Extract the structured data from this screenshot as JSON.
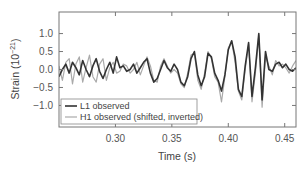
{
  "chart_data": {
    "type": "line",
    "title": "",
    "xlabel": "Time (s)",
    "ylabel": "Strain (10⁻²¹)",
    "ylabel_base": "Strain (10",
    "ylabel_exp": "−21",
    "ylabel_close": ")",
    "xlim": [
      0.25,
      0.46
    ],
    "ylim": [
      -1.6,
      1.6
    ],
    "xticks": [
      0.3,
      0.35,
      0.4,
      0.45
    ],
    "xtick_labels": [
      "0.30",
      "0.35",
      "0.40",
      "0.45"
    ],
    "yticks": [
      1.0,
      0.5,
      0.0,
      -0.5,
      -1.0
    ],
    "ytick_labels": [
      "1.0",
      "0.5",
      "0.0",
      "−0.5",
      "−1.0"
    ],
    "grid": false,
    "legend_position": "lower left",
    "series": [
      {
        "name": "L1 observed",
        "color": "#333333",
        "x": [
          0.25,
          0.253,
          0.256,
          0.259,
          0.262,
          0.265,
          0.268,
          0.271,
          0.274,
          0.277,
          0.28,
          0.283,
          0.286,
          0.289,
          0.292,
          0.295,
          0.298,
          0.301,
          0.304,
          0.307,
          0.31,
          0.313,
          0.316,
          0.319,
          0.322,
          0.325,
          0.328,
          0.331,
          0.334,
          0.337,
          0.34,
          0.343,
          0.346,
          0.349,
          0.352,
          0.355,
          0.358,
          0.361,
          0.364,
          0.367,
          0.37,
          0.373,
          0.376,
          0.379,
          0.382,
          0.385,
          0.388,
          0.391,
          0.394,
          0.397,
          0.4,
          0.403,
          0.406,
          0.409,
          0.412,
          0.415,
          0.418,
          0.421,
          0.424,
          0.427,
          0.43,
          0.433,
          0.436,
          0.439,
          0.442,
          0.445,
          0.448,
          0.451,
          0.454,
          0.457,
          0.46
        ],
        "values": [
          -0.2,
          0.0,
          0.15,
          -0.1,
          0.2,
          0.05,
          -0.15,
          0.25,
          0.0,
          -0.2,
          0.1,
          0.3,
          -0.05,
          -0.25,
          0.0,
          0.2,
          -0.1,
          0.35,
          0.05,
          0.1,
          -0.05,
          0.0,
          0.15,
          -0.1,
          0.05,
          0.2,
          0.3,
          -0.1,
          -0.35,
          -0.25,
          0.0,
          0.25,
          0.05,
          -0.05,
          0.15,
          0.0,
          -0.35,
          -0.45,
          -0.2,
          0.3,
          0.5,
          -0.15,
          -0.45,
          -0.2,
          0.45,
          0.35,
          -0.1,
          -0.3,
          -0.6,
          -0.15,
          0.55,
          0.8,
          0.35,
          -0.55,
          -0.75,
          0.1,
          0.75,
          -0.75,
          0.05,
          1.0,
          -0.85,
          0.5,
          0.0,
          -0.05,
          0.15,
          0.2,
          0.05,
          0.15,
          0.0,
          -0.05,
          0.05
        ]
      },
      {
        "name": "H1 observed (shifted, inverted)",
        "color": "#aaaaaa",
        "x": [
          0.25,
          0.253,
          0.256,
          0.259,
          0.262,
          0.265,
          0.268,
          0.271,
          0.274,
          0.277,
          0.28,
          0.283,
          0.286,
          0.289,
          0.292,
          0.295,
          0.298,
          0.301,
          0.304,
          0.307,
          0.31,
          0.313,
          0.316,
          0.319,
          0.322,
          0.325,
          0.328,
          0.331,
          0.334,
          0.337,
          0.34,
          0.343,
          0.346,
          0.349,
          0.352,
          0.355,
          0.358,
          0.361,
          0.364,
          0.367,
          0.37,
          0.373,
          0.376,
          0.379,
          0.382,
          0.385,
          0.388,
          0.391,
          0.394,
          0.397,
          0.4,
          0.403,
          0.406,
          0.409,
          0.412,
          0.415,
          0.418,
          0.421,
          0.424,
          0.427,
          0.43,
          0.433,
          0.436,
          0.439,
          0.442,
          0.445,
          0.448,
          0.451,
          0.454,
          0.457,
          0.46
        ],
        "values": [
          0.1,
          -0.3,
          0.2,
          0.3,
          -0.4,
          0.15,
          0.35,
          -0.35,
          0.05,
          0.4,
          -0.2,
          -0.35,
          0.15,
          0.3,
          -0.3,
          0.05,
          0.2,
          -0.1,
          -0.05,
          0.15,
          0.1,
          -0.1,
          0.0,
          0.2,
          -0.15,
          0.1,
          0.35,
          0.1,
          -0.3,
          -0.35,
          0.1,
          0.3,
          0.1,
          -0.1,
          0.0,
          -0.1,
          -0.4,
          -0.5,
          -0.1,
          0.4,
          0.45,
          -0.3,
          -0.55,
          -0.1,
          0.5,
          0.3,
          -0.2,
          -0.35,
          -0.9,
          -0.2,
          0.6,
          0.8,
          0.2,
          -0.6,
          -0.85,
          0.0,
          0.7,
          -0.9,
          -0.1,
          0.95,
          -1.05,
          0.35,
          0.1,
          -0.15,
          0.25,
          0.1,
          0.15,
          0.05,
          -0.1,
          0.1,
          0.25
        ]
      }
    ]
  }
}
